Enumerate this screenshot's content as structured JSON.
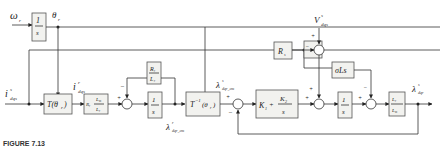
{
  "diagram": {
    "inputs": {
      "omega": "ω",
      "omega_sub": "r",
      "current": "i",
      "current_sup": "s",
      "current_sub": "dqs",
      "voltage": "V",
      "voltage_sup": "s",
      "voltage_sub": "dqs"
    },
    "signals": {
      "theta": "θ",
      "theta_sub": "r",
      "i_r": "i",
      "i_r_sup": "r",
      "i_r_sub": "dqs",
      "lambda_cm_top": "λ",
      "lambda_cm_top_sup": "s",
      "lambda_cm_top_sub": "dqr_cm",
      "lambda_cm_bot": "λ",
      "lambda_cm_bot_sup": "r",
      "lambda_cm_bot_sub": "dqr_cm",
      "lambda_out": "λ",
      "lambda_out_sup": "s",
      "lambda_out_sub": "dqr"
    },
    "blocks": {
      "integrator1": {
        "num": "1",
        "den": "s"
      },
      "transform": "T(θr)",
      "transform_text": "T(θ",
      "transform_sub": "r",
      "gain_rl": {
        "pre": "Rr",
        "num": "Lm",
        "den": "Lr"
      },
      "rr_lr": {
        "num": "Rr",
        "den": "Lr"
      },
      "integrator2": {
        "num": "1",
        "den": "s"
      },
      "inv_transform_text": "T",
      "inv_transform_sup": "−1",
      "inv_transform_arg": "(θr)",
      "pi": {
        "k1": "K",
        "k1_sub": "1",
        "k2": "K",
        "k2_sub": "2",
        "den": "s"
      },
      "rs": "Rs",
      "sigma_ls": "σLs",
      "integrator3": {
        "num": "1",
        "den": "s"
      },
      "lr_lm": {
        "num": "Lr",
        "den": "Lm"
      }
    },
    "signs": {
      "plus": "+",
      "minus": "−"
    },
    "caption": "FIGURE 7.13"
  }
}
